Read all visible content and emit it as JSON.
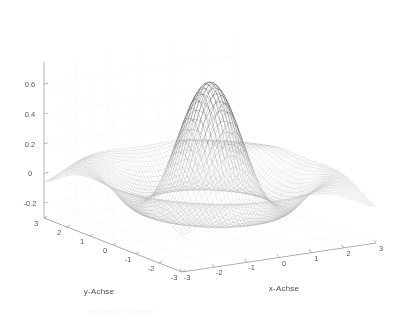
{
  "figure": {
    "background_color": "#ffffff",
    "plot_type": "3d-mesh-surface",
    "renderer": "matlab-mesh",
    "mesh_color": "#555555",
    "grid_color": "#e3e3e3",
    "axis_color": "#9a9a9a",
    "tick_text_color": "#555555",
    "label_text_color": "#4a4a4a"
  },
  "axes": {
    "x": {
      "label": "x-Achse",
      "ticks": [
        -3,
        -2,
        -1,
        0,
        1,
        2,
        3
      ],
      "tick_labels": [
        "-3",
        "-2",
        "-1",
        "0",
        "1",
        "2",
        "3"
      ],
      "range": [
        -3,
        3
      ]
    },
    "y": {
      "label": "y-Achse",
      "ticks": [
        -3,
        -2,
        -1,
        0,
        1,
        2,
        3
      ],
      "tick_labels": [
        "-3",
        "-2",
        "-1",
        "0",
        "1",
        "2",
        "3"
      ],
      "range": [
        -3,
        3
      ]
    },
    "z": {
      "label": "",
      "ticks": [
        -0.2,
        0,
        0.2,
        0.4,
        0.6
      ],
      "tick_labels": [
        "-0.2",
        "0",
        "0.2",
        "0.4",
        "0.6"
      ],
      "range": [
        -0.3,
        0.75
      ]
    }
  },
  "caption": {
    "text": "Abbildung:  3D-Gitternetz"
  },
  "chart_data": {
    "type": "surface",
    "title": "",
    "xlabel": "x-Achse",
    "ylabel": "y-Achse",
    "zlabel": "",
    "xlim": [
      -3,
      3
    ],
    "ylim": [
      -3,
      3
    ],
    "zlim": [
      -0.3,
      0.75
    ],
    "grid": true,
    "legend": false,
    "legend_position": "none",
    "function": "sin(pi*sqrt(x^2+y^2)*2.2)/(pi*sqrt(x^2+y^2)*2.2) scaled",
    "x_tick_labels": [
      "-3",
      "-2",
      "-1",
      "0",
      "1",
      "2",
      "3"
    ],
    "y_tick_labels": [
      "-3",
      "-2",
      "-1",
      "0",
      "1",
      "2",
      "3"
    ],
    "z_tick_labels": [
      "-0.2",
      "0",
      "0.2",
      "0.4",
      "0.6"
    ],
    "x_ticks": [
      -3,
      -2,
      -1,
      0,
      1,
      2,
      3
    ],
    "y_ticks": [
      -3,
      -2,
      -1,
      0,
      1,
      2,
      3
    ],
    "z_ticks": [
      -0.2,
      0,
      0.2,
      0.4,
      0.6
    ],
    "grid_n": 61,
    "view_azimuth_deg": -37.5,
    "view_elevation_deg": 24,
    "z_max_observed": 0.7,
    "z_min_observed": -0.27,
    "center_peak_value": 0.7,
    "first_trough_value": -0.22,
    "second_ring_value": 0.12
  },
  "geometry": {
    "origin_x": 182,
    "origin_y": 272,
    "left_corner_x": 44,
    "left_corner_y": 218,
    "right_corner_x": 376,
    "right_corner_y": 243,
    "z_axis_top_y": 62,
    "z_axis_bottom_y": 218
  }
}
